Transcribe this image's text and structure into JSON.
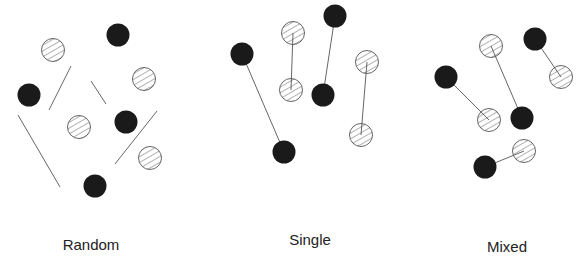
{
  "colors": {
    "solid": "#1a1a1a",
    "hatch_stroke": "#555555",
    "line": "#666666",
    "background": "#ffffff"
  },
  "icons": {
    "solid": "solid-particle-icon",
    "hatched": "hatched-particle-icon"
  },
  "panels": [
    {
      "label": "Random",
      "label_pos": [
        91,
        236
      ],
      "particles": [
        {
          "type": "hatched",
          "cx": 53,
          "cy": 50
        },
        {
          "type": "solid",
          "cx": 118,
          "cy": 35
        },
        {
          "type": "hatched",
          "cx": 144,
          "cy": 79
        },
        {
          "type": "solid",
          "cx": 29,
          "cy": 95
        },
        {
          "type": "hatched",
          "cx": 79,
          "cy": 127
        },
        {
          "type": "solid",
          "cx": 126,
          "cy": 122
        },
        {
          "type": "hatched",
          "cx": 150,
          "cy": 158
        },
        {
          "type": "solid",
          "cx": 95,
          "cy": 186
        }
      ],
      "lines": [
        {
          "x1": 71,
          "y1": 66,
          "x2": 49,
          "y2": 110
        },
        {
          "x1": 91,
          "y1": 81,
          "x2": 106,
          "y2": 104
        },
        {
          "x1": 18,
          "y1": 115,
          "x2": 60,
          "y2": 187
        },
        {
          "x1": 157,
          "y1": 111,
          "x2": 115,
          "y2": 164
        }
      ]
    },
    {
      "label": "Single",
      "label_pos": [
        310,
        231
      ],
      "particles": [
        {
          "type": "solid",
          "cx": 242,
          "cy": 54
        },
        {
          "type": "solid",
          "cx": 284,
          "cy": 152
        },
        {
          "type": "hatched",
          "cx": 293,
          "cy": 33
        },
        {
          "type": "hatched",
          "cx": 291,
          "cy": 90
        },
        {
          "type": "solid",
          "cx": 335,
          "cy": 16
        },
        {
          "type": "solid",
          "cx": 323,
          "cy": 95
        },
        {
          "type": "hatched",
          "cx": 367,
          "cy": 62
        },
        {
          "type": "hatched",
          "cx": 361,
          "cy": 135
        }
      ],
      "lines": [
        {
          "x1": 242,
          "y1": 54,
          "x2": 284,
          "y2": 152
        },
        {
          "x1": 293,
          "y1": 33,
          "x2": 291,
          "y2": 90
        },
        {
          "x1": 335,
          "y1": 16,
          "x2": 323,
          "y2": 95
        },
        {
          "x1": 367,
          "y1": 62,
          "x2": 361,
          "y2": 135
        }
      ]
    },
    {
      "label": "Mixed",
      "label_pos": [
        507,
        238
      ],
      "particles": [
        {
          "type": "solid",
          "cx": 535,
          "cy": 39
        },
        {
          "type": "hatched",
          "cx": 561,
          "cy": 77
        },
        {
          "type": "hatched",
          "cx": 491,
          "cy": 46
        },
        {
          "type": "solid",
          "cx": 522,
          "cy": 118
        },
        {
          "type": "solid",
          "cx": 446,
          "cy": 77
        },
        {
          "type": "hatched",
          "cx": 489,
          "cy": 120
        },
        {
          "type": "hatched",
          "cx": 524,
          "cy": 151
        },
        {
          "type": "solid",
          "cx": 485,
          "cy": 167
        }
      ],
      "lines": [
        {
          "x1": 535,
          "y1": 39,
          "x2": 561,
          "y2": 77
        },
        {
          "x1": 491,
          "y1": 46,
          "x2": 522,
          "y2": 118
        },
        {
          "x1": 446,
          "y1": 77,
          "x2": 489,
          "y2": 120
        },
        {
          "x1": 524,
          "y1": 151,
          "x2": 485,
          "y2": 167
        }
      ]
    }
  ]
}
